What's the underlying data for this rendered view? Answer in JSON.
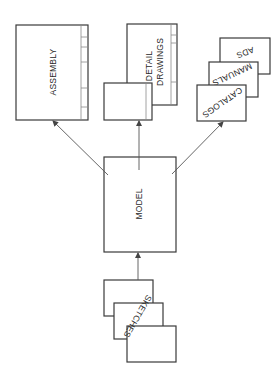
{
  "diagram": {
    "type": "flow",
    "direction": "bottom-to-top",
    "nodes": {
      "sketches": {
        "label": "SKETCHES",
        "stack_count": 3
      },
      "model": {
        "label": "MODEL"
      },
      "assembly": {
        "label": "ASSEMBLY"
      },
      "detail_drawings": {
        "label_line1": "DETAIL",
        "label_line2": "DRAWINGS"
      },
      "catalogs": {
        "label": "CATALOGS"
      },
      "manuals": {
        "label": "MANUALS"
      },
      "ads": {
        "label": "ADS"
      }
    },
    "edges": [
      {
        "from": "SKETCHES",
        "to": "MODEL"
      },
      {
        "from": "MODEL",
        "to": "ASSEMBLY"
      },
      {
        "from": "MODEL",
        "to": "DETAIL DRAWINGS"
      },
      {
        "from": "MODEL",
        "to": "CATALOGS / MANUALS / ADS"
      }
    ],
    "colors": {
      "stroke": "#3a3a3a",
      "arrow": "#555555",
      "text": "#2a2a2a",
      "background": "#ffffff"
    }
  }
}
